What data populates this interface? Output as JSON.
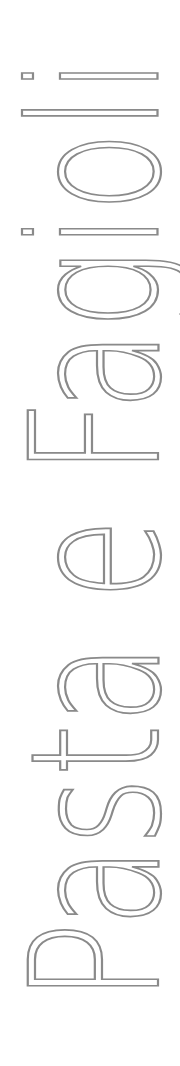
{
  "cover": {
    "title": "Pasta e Fagioli",
    "orientation": "vertical, reading bottom-to-top",
    "text_color": "#8a8a8a",
    "background_color": "#ffffff"
  }
}
